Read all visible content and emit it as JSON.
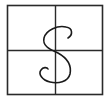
{
  "practice_grid": {
    "letter": "S",
    "stroke_color": "#1a1a1a",
    "grid_color": "#2a2a2a",
    "background_color": "#ffffff",
    "quadrants": 4
  }
}
